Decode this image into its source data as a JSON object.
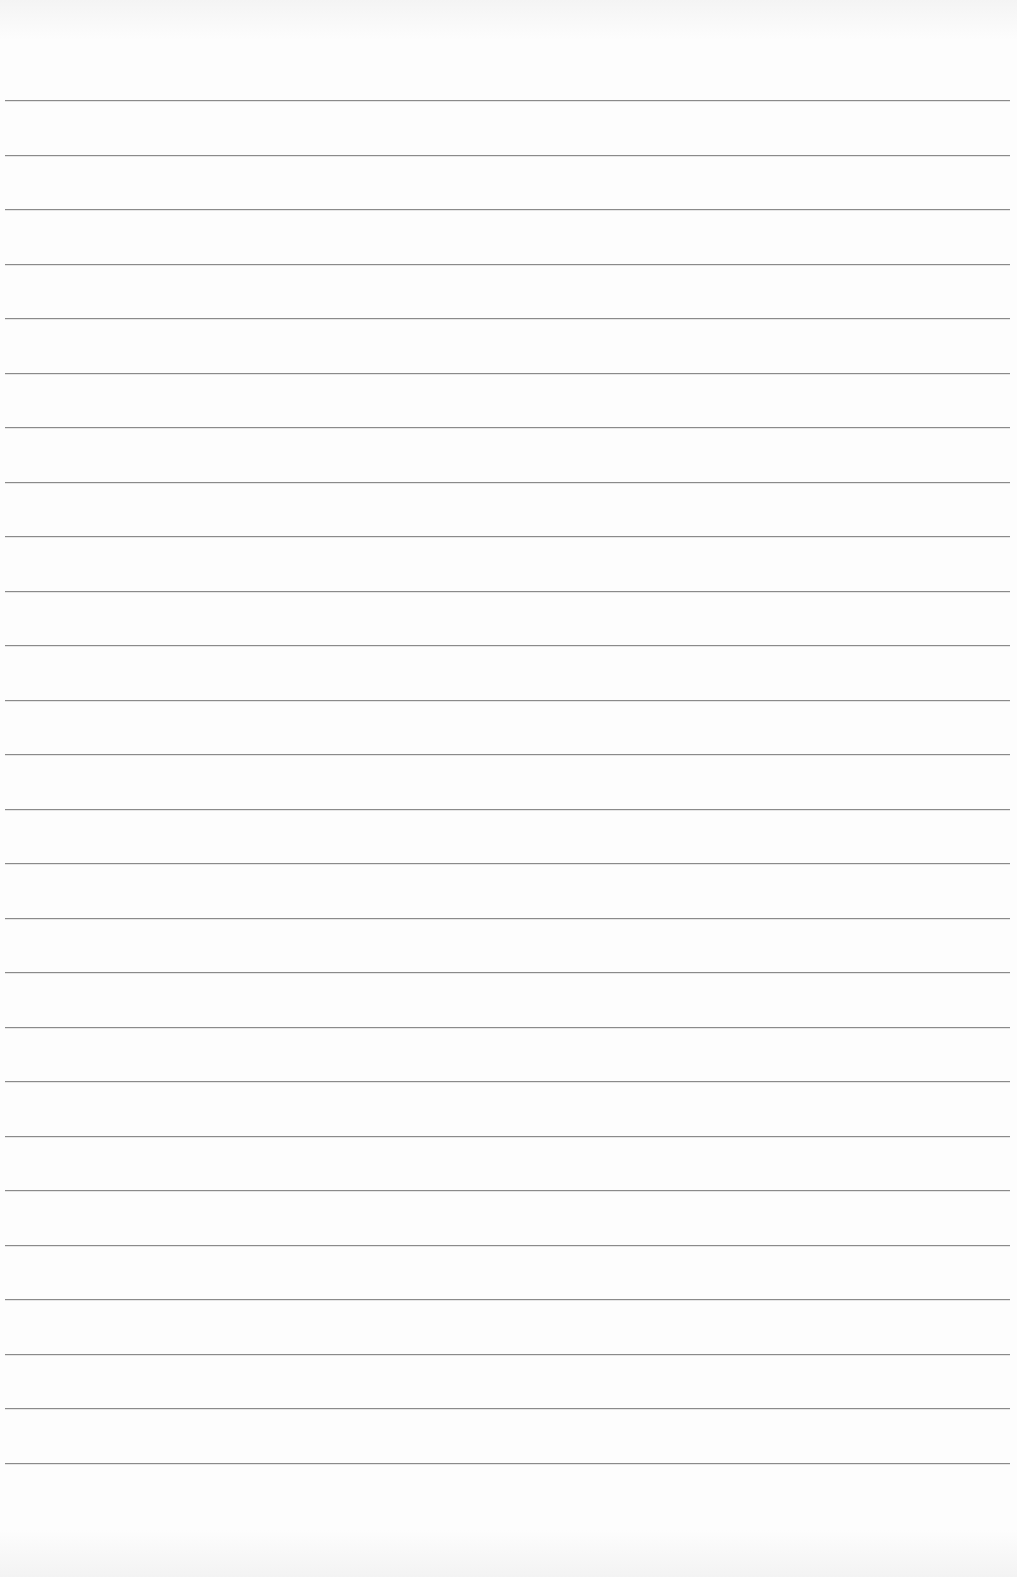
{
  "page": {
    "type": "ruled notebook paper",
    "background_color": "#fbfbfb",
    "line_color": "#8a8a8a",
    "line_count": 26,
    "first_line_y": 100,
    "line_spacing": 54.6,
    "text": ""
  }
}
